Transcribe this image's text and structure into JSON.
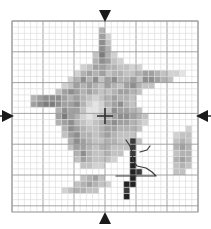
{
  "view": {
    "width": 211,
    "height": 229,
    "background": "#ffffff"
  },
  "grid": {
    "x": 12,
    "y": 21,
    "width": 186,
    "height": 191,
    "cols": 30,
    "rows": 31,
    "cell_w": 6.2,
    "cell_h": 6.16,
    "minor_color": "#d8d8d8",
    "major_color": "#9a9a9a",
    "major_every": 5,
    "border_color": "#9a9a9a",
    "grid_on": true
  },
  "crosshair": {
    "name": "center-crosshair",
    "x": 105,
    "y": 116,
    "arm": 8,
    "color": "#333333",
    "thickness": 1.6
  },
  "markers": [
    {
      "name": "marker-top",
      "direction": "down",
      "x": 105,
      "y": 16,
      "size": 6,
      "color": "#1a1a1a"
    },
    {
      "name": "marker-bottom",
      "direction": "up",
      "x": 105,
      "y": 218,
      "size": 6,
      "color": "#1a1a1a"
    },
    {
      "name": "marker-left",
      "direction": "right",
      "x": 8,
      "y": 116,
      "size": 6,
      "color": "#1a1a1a"
    },
    {
      "name": "marker-right",
      "direction": "left",
      "x": 202,
      "y": 116,
      "size": 6,
      "color": "#1a1a1a"
    }
  ],
  "tick_lines": [
    {
      "name": "tick-left",
      "x1": 0,
      "y1": 116,
      "x2": 4,
      "y2": 116,
      "color": "#1a1a1a"
    },
    {
      "name": "tick-right",
      "x1": 207,
      "y1": 116,
      "x2": 211,
      "y2": 116,
      "color": "#1a1a1a"
    }
  ],
  "palette": {
    "l1": "#f2f2f2",
    "l2": "#e4e4e4",
    "l3": "#d2d2d2",
    "l4": "#c2c2c2",
    "l5": "#b2b2b2",
    "l6": "#a0a0a0",
    "l7": "#8e8e8e",
    "l8": "#7c7c7c",
    "l9": "#6a6a6a",
    "l10": "#555555",
    "l11": "#3a3a3a",
    "l12": "#222222"
  },
  "chart_data": {
    "type": "heatmap",
    "title": "",
    "xlabel": "",
    "ylabel": "",
    "cols": 30,
    "rows": 31,
    "note": "grayscale intensity map; cells listed as [col,row,level]",
    "cells": [
      [
        14,
        1,
        "l5"
      ],
      [
        14,
        2,
        "l6"
      ],
      [
        15,
        2,
        "l3"
      ],
      [
        14,
        3,
        "l7"
      ],
      [
        15,
        3,
        "l4"
      ],
      [
        14,
        4,
        "l7"
      ],
      [
        15,
        4,
        "l5"
      ],
      [
        13,
        5,
        "l4"
      ],
      [
        14,
        5,
        "l8"
      ],
      [
        15,
        5,
        "l5"
      ],
      [
        16,
        5,
        "l3"
      ],
      [
        13,
        6,
        "l5"
      ],
      [
        14,
        6,
        "l7"
      ],
      [
        15,
        6,
        "l6"
      ],
      [
        16,
        6,
        "l4"
      ],
      [
        17,
        6,
        "l3"
      ],
      [
        11,
        7,
        "l3"
      ],
      [
        12,
        7,
        "l4"
      ],
      [
        13,
        7,
        "l6"
      ],
      [
        14,
        7,
        "l6"
      ],
      [
        15,
        7,
        "l5"
      ],
      [
        16,
        7,
        "l5"
      ],
      [
        17,
        7,
        "l4"
      ],
      [
        18,
        7,
        "l4"
      ],
      [
        19,
        7,
        "l3"
      ],
      [
        20,
        7,
        "l3"
      ],
      [
        10,
        8,
        "l3"
      ],
      [
        11,
        8,
        "l5"
      ],
      [
        12,
        8,
        "l6"
      ],
      [
        13,
        8,
        "l5"
      ],
      [
        14,
        8,
        "l6"
      ],
      [
        15,
        8,
        "l4"
      ],
      [
        16,
        8,
        "l5"
      ],
      [
        17,
        8,
        "l5"
      ],
      [
        18,
        8,
        "l4"
      ],
      [
        19,
        8,
        "l4"
      ],
      [
        20,
        8,
        "l5"
      ],
      [
        21,
        8,
        "l6"
      ],
      [
        22,
        8,
        "l6"
      ],
      [
        23,
        8,
        "l5"
      ],
      [
        24,
        8,
        "l4"
      ],
      [
        25,
        8,
        "l3"
      ],
      [
        26,
        8,
        "l3"
      ],
      [
        27,
        8,
        "l2"
      ],
      [
        9,
        9,
        "l3"
      ],
      [
        10,
        9,
        "l5"
      ],
      [
        11,
        9,
        "l7"
      ],
      [
        12,
        9,
        "l5"
      ],
      [
        13,
        9,
        "l7"
      ],
      [
        14,
        9,
        "l4"
      ],
      [
        15,
        9,
        "l6"
      ],
      [
        16,
        9,
        "l7"
      ],
      [
        17,
        9,
        "l5"
      ],
      [
        18,
        9,
        "l5"
      ],
      [
        19,
        9,
        "l6"
      ],
      [
        20,
        9,
        "l4"
      ],
      [
        21,
        9,
        "l7"
      ],
      [
        22,
        9,
        "l7"
      ],
      [
        23,
        9,
        "l6"
      ],
      [
        24,
        9,
        "l5"
      ],
      [
        25,
        9,
        "l4"
      ],
      [
        8,
        10,
        "l3"
      ],
      [
        9,
        10,
        "l4"
      ],
      [
        10,
        10,
        "l6"
      ],
      [
        11,
        10,
        "l5"
      ],
      [
        12,
        10,
        "l6"
      ],
      [
        13,
        10,
        "l5"
      ],
      [
        14,
        10,
        "l4"
      ],
      [
        15,
        10,
        "l6"
      ],
      [
        16,
        10,
        "l5"
      ],
      [
        17,
        10,
        "l4"
      ],
      [
        18,
        10,
        "l6"
      ],
      [
        19,
        10,
        "l7"
      ],
      [
        20,
        10,
        "l5"
      ],
      [
        21,
        10,
        "l4"
      ],
      [
        22,
        10,
        "l4"
      ],
      [
        7,
        11,
        "l4"
      ],
      [
        8,
        11,
        "l6"
      ],
      [
        9,
        11,
        "l7"
      ],
      [
        10,
        11,
        "l6"
      ],
      [
        11,
        11,
        "l5"
      ],
      [
        12,
        11,
        "l6"
      ],
      [
        13,
        11,
        "l5"
      ],
      [
        14,
        11,
        "l4"
      ],
      [
        15,
        11,
        "l4"
      ],
      [
        16,
        11,
        "l5"
      ],
      [
        17,
        11,
        "l6"
      ],
      [
        18,
        11,
        "l6"
      ],
      [
        19,
        11,
        "l5"
      ],
      [
        20,
        11,
        "l4"
      ],
      [
        3,
        12,
        "l5"
      ],
      [
        4,
        12,
        "l6"
      ],
      [
        5,
        12,
        "l7"
      ],
      [
        6,
        12,
        "l7"
      ],
      [
        7,
        12,
        "l7"
      ],
      [
        8,
        12,
        "l6"
      ],
      [
        9,
        12,
        "l5"
      ],
      [
        10,
        12,
        "l6"
      ],
      [
        11,
        12,
        "l5"
      ],
      [
        12,
        12,
        "l4"
      ],
      [
        13,
        12,
        "l3"
      ],
      [
        14,
        12,
        "l4"
      ],
      [
        15,
        12,
        "l5"
      ],
      [
        16,
        12,
        "l6"
      ],
      [
        17,
        12,
        "l5"
      ],
      [
        18,
        12,
        "l5"
      ],
      [
        19,
        12,
        "l4"
      ],
      [
        3,
        13,
        "l6"
      ],
      [
        4,
        13,
        "l7"
      ],
      [
        5,
        13,
        "l8"
      ],
      [
        6,
        13,
        "l8"
      ],
      [
        7,
        13,
        "l7"
      ],
      [
        8,
        13,
        "l6"
      ],
      [
        9,
        13,
        "l6"
      ],
      [
        10,
        13,
        "l7"
      ],
      [
        11,
        13,
        "l5"
      ],
      [
        12,
        13,
        "l3"
      ],
      [
        13,
        13,
        "l2"
      ],
      [
        14,
        13,
        "l3"
      ],
      [
        15,
        13,
        "l5"
      ],
      [
        16,
        13,
        "l6"
      ],
      [
        17,
        13,
        "l7"
      ],
      [
        18,
        13,
        "l5"
      ],
      [
        19,
        13,
        "l4"
      ],
      [
        7,
        14,
        "l5"
      ],
      [
        8,
        14,
        "l7"
      ],
      [
        9,
        14,
        "l6"
      ],
      [
        10,
        14,
        "l6"
      ],
      [
        11,
        14,
        "l4"
      ],
      [
        12,
        14,
        "l2"
      ],
      [
        13,
        14,
        "l2"
      ],
      [
        14,
        14,
        "l3"
      ],
      [
        15,
        14,
        "l4"
      ],
      [
        16,
        14,
        "l7"
      ],
      [
        17,
        14,
        "l6"
      ],
      [
        18,
        14,
        "l6"
      ],
      [
        19,
        14,
        "l5"
      ],
      [
        20,
        14,
        "l4"
      ],
      [
        7,
        15,
        "l6"
      ],
      [
        8,
        15,
        "l8"
      ],
      [
        9,
        15,
        "l6"
      ],
      [
        10,
        15,
        "l5"
      ],
      [
        11,
        15,
        "l3"
      ],
      [
        12,
        15,
        "l2"
      ],
      [
        13,
        15,
        "l3"
      ],
      [
        14,
        15,
        "l4"
      ],
      [
        15,
        15,
        "l5"
      ],
      [
        16,
        15,
        "l6"
      ],
      [
        17,
        15,
        "l7"
      ],
      [
        18,
        15,
        "l7"
      ],
      [
        19,
        15,
        "l6"
      ],
      [
        20,
        15,
        "l5"
      ],
      [
        21,
        15,
        "l4"
      ],
      [
        7,
        16,
        "l5"
      ],
      [
        8,
        16,
        "l6"
      ],
      [
        9,
        16,
        "l7"
      ],
      [
        10,
        16,
        "l5"
      ],
      [
        11,
        16,
        "l4"
      ],
      [
        12,
        16,
        "l3"
      ],
      [
        13,
        16,
        "l4"
      ],
      [
        14,
        16,
        "l5"
      ],
      [
        15,
        16,
        "l6"
      ],
      [
        16,
        16,
        "l7"
      ],
      [
        17,
        16,
        "l6"
      ],
      [
        18,
        16,
        "l6"
      ],
      [
        19,
        16,
        "l5"
      ],
      [
        20,
        16,
        "l4"
      ],
      [
        21,
        16,
        "l3"
      ],
      [
        8,
        17,
        "l5"
      ],
      [
        9,
        17,
        "l7"
      ],
      [
        10,
        17,
        "l6"
      ],
      [
        11,
        17,
        "l5"
      ],
      [
        12,
        17,
        "l4"
      ],
      [
        13,
        17,
        "l4"
      ],
      [
        14,
        17,
        "l5"
      ],
      [
        15,
        17,
        "l6"
      ],
      [
        16,
        17,
        "l6"
      ],
      [
        17,
        17,
        "l5"
      ],
      [
        18,
        17,
        "l5"
      ],
      [
        19,
        17,
        "l5"
      ],
      [
        20,
        17,
        "l4"
      ],
      [
        28,
        17,
        "l3"
      ],
      [
        8,
        18,
        "l4"
      ],
      [
        9,
        18,
        "l6"
      ],
      [
        10,
        18,
        "l7"
      ],
      [
        11,
        18,
        "l5"
      ],
      [
        12,
        18,
        "l5"
      ],
      [
        13,
        18,
        "l4"
      ],
      [
        14,
        18,
        "l5"
      ],
      [
        15,
        18,
        "l6"
      ],
      [
        16,
        18,
        "l5"
      ],
      [
        17,
        18,
        "l4"
      ],
      [
        18,
        18,
        "l4"
      ],
      [
        19,
        18,
        "l4"
      ],
      [
        26,
        18,
        "l3"
      ],
      [
        27,
        18,
        "l4"
      ],
      [
        28,
        18,
        "l4"
      ],
      [
        9,
        19,
        "l5"
      ],
      [
        10,
        19,
        "l7"
      ],
      [
        11,
        19,
        "l6"
      ],
      [
        12,
        19,
        "l5"
      ],
      [
        13,
        19,
        "l4"
      ],
      [
        14,
        19,
        "l4"
      ],
      [
        15,
        19,
        "l5"
      ],
      [
        16,
        19,
        "l5"
      ],
      [
        17,
        19,
        "l4"
      ],
      [
        18,
        19,
        "l4"
      ],
      [
        19,
        19,
        "l11"
      ],
      [
        20,
        19,
        "l4"
      ],
      [
        26,
        19,
        "l4"
      ],
      [
        27,
        19,
        "l5"
      ],
      [
        28,
        19,
        "l4"
      ],
      [
        9,
        20,
        "l4"
      ],
      [
        10,
        20,
        "l6"
      ],
      [
        11,
        20,
        "l6"
      ],
      [
        12,
        20,
        "l5"
      ],
      [
        13,
        20,
        "l4"
      ],
      [
        14,
        20,
        "l5"
      ],
      [
        15,
        20,
        "l5"
      ],
      [
        16,
        20,
        "l4"
      ],
      [
        17,
        20,
        "l4"
      ],
      [
        18,
        20,
        "l4"
      ],
      [
        19,
        20,
        "l11"
      ],
      [
        26,
        20,
        "l5"
      ],
      [
        27,
        20,
        "l6"
      ],
      [
        28,
        20,
        "l5"
      ],
      [
        10,
        21,
        "l5"
      ],
      [
        11,
        21,
        "l7"
      ],
      [
        12,
        21,
        "l5"
      ],
      [
        13,
        21,
        "l4"
      ],
      [
        14,
        21,
        "l4"
      ],
      [
        15,
        21,
        "l5"
      ],
      [
        16,
        21,
        "l4"
      ],
      [
        17,
        21,
        "l4"
      ],
      [
        19,
        21,
        "l11"
      ],
      [
        26,
        21,
        "l4"
      ],
      [
        27,
        21,
        "l5"
      ],
      [
        28,
        21,
        "l5"
      ],
      [
        10,
        22,
        "l4"
      ],
      [
        11,
        22,
        "l6"
      ],
      [
        12,
        22,
        "l5"
      ],
      [
        13,
        22,
        "l4"
      ],
      [
        14,
        22,
        "l4"
      ],
      [
        15,
        22,
        "l4"
      ],
      [
        16,
        22,
        "l3"
      ],
      [
        19,
        22,
        "l12"
      ],
      [
        26,
        22,
        "l5"
      ],
      [
        27,
        22,
        "l6"
      ],
      [
        28,
        22,
        "l5"
      ],
      [
        11,
        23,
        "l4"
      ],
      [
        12,
        23,
        "l4"
      ],
      [
        13,
        23,
        "l3"
      ],
      [
        14,
        23,
        "l3"
      ],
      [
        19,
        23,
        "l12"
      ],
      [
        26,
        23,
        "l4"
      ],
      [
        27,
        23,
        "l5"
      ],
      [
        28,
        23,
        "l4"
      ],
      [
        19,
        24,
        "l12"
      ],
      [
        20,
        24,
        "l11"
      ],
      [
        26,
        24,
        "l4"
      ],
      [
        27,
        24,
        "l4"
      ],
      [
        11,
        25,
        "l4"
      ],
      [
        12,
        25,
        "l5"
      ],
      [
        13,
        25,
        "l6"
      ],
      [
        14,
        25,
        "l4"
      ],
      [
        19,
        25,
        "l12"
      ],
      [
        10,
        26,
        "l4"
      ],
      [
        11,
        26,
        "l5"
      ],
      [
        12,
        26,
        "l6"
      ],
      [
        13,
        26,
        "l5"
      ],
      [
        14,
        26,
        "l4"
      ],
      [
        15,
        26,
        "l3"
      ],
      [
        18,
        26,
        "l12"
      ],
      [
        19,
        26,
        "l12"
      ],
      [
        8,
        27,
        "l3"
      ],
      [
        9,
        27,
        "l4"
      ],
      [
        10,
        27,
        "l5"
      ],
      [
        11,
        27,
        "l5"
      ],
      [
        12,
        27,
        "l4"
      ],
      [
        13,
        27,
        "l4"
      ],
      [
        18,
        27,
        "l11"
      ],
      [
        18,
        28,
        "l12"
      ]
    ],
    "paths": [
      {
        "name": "contour-path",
        "color": "#3a3a3a",
        "width": 1.2,
        "points": [
          [
            126,
            140
          ],
          [
            130,
            146
          ],
          [
            132,
            152
          ],
          [
            133,
            160
          ],
          [
            137,
            166
          ],
          [
            146,
            168
          ],
          [
            152,
            172
          ],
          [
            156,
            176
          ],
          [
            140,
            176
          ],
          [
            128,
            176
          ],
          [
            116,
            176
          ]
        ]
      },
      {
        "name": "contour-path-tail",
        "color": "#3a3a3a",
        "width": 1.2,
        "points": [
          [
            140,
            152
          ],
          [
            147,
            150
          ],
          [
            150,
            146
          ]
        ]
      }
    ]
  }
}
